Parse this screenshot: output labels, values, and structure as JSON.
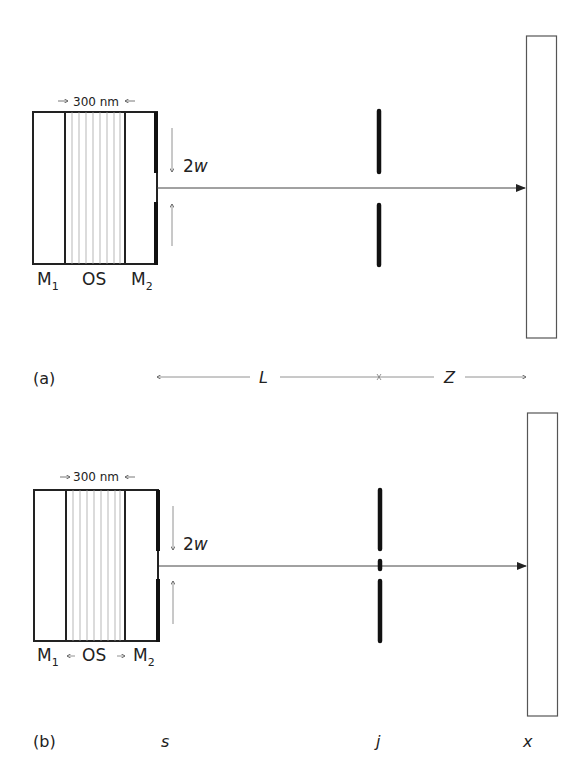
{
  "panels": [
    {
      "id": "a",
      "label": "(a)",
      "thickness_label": "300 nm",
      "layer_labels": {
        "m1": "M",
        "m1_sub": "1",
        "os": "OS",
        "m2": "M",
        "m2_sub": "2"
      },
      "aperture_label": "2w",
      "distance_labels": {
        "L": "L",
        "Z": "Z"
      }
    },
    {
      "id": "b",
      "label": "(b)",
      "thickness_label": "300 nm",
      "layer_labels": {
        "m1": "M",
        "m1_sub": "1",
        "os": "OS",
        "m2": "M",
        "m2_sub": "2"
      },
      "aperture_label": "2w",
      "position_labels": {
        "s": "s",
        "j": "j",
        "x": "x"
      }
    }
  ],
  "colors": {
    "line": "#222222",
    "hatch": "#9a9a9a",
    "screen": "#555555"
  }
}
